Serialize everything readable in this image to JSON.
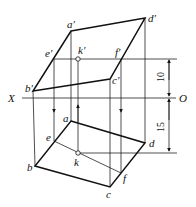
{
  "diagram": {
    "type": "orthographic projection of a plane (parallelogram) with point K",
    "axis": {
      "left_label": "X",
      "right_label": "O"
    },
    "front_view": {
      "vertices": [
        "a'",
        "b'",
        "c'",
        "d'"
      ],
      "line_points": [
        "e'",
        "f'"
      ],
      "point": "k'"
    },
    "top_view": {
      "vertices": [
        "a",
        "b",
        "c",
        "d"
      ],
      "line_points": [
        "e",
        "f"
      ],
      "point": "k"
    },
    "dimensions": {
      "upper": "10",
      "lower": "15"
    }
  },
  "labels": {
    "a_prime": "a′",
    "b_prime": "b′",
    "c_prime": "c′",
    "d_prime": "d′",
    "e_prime": "e′",
    "f_prime": "f′",
    "k_prime": "k′",
    "a": "a",
    "b": "b",
    "c": "c",
    "d": "d",
    "e": "e",
    "f": "f",
    "k": "k",
    "x": "X",
    "o": "O",
    "dim10": "10",
    "dim15": "15"
  }
}
